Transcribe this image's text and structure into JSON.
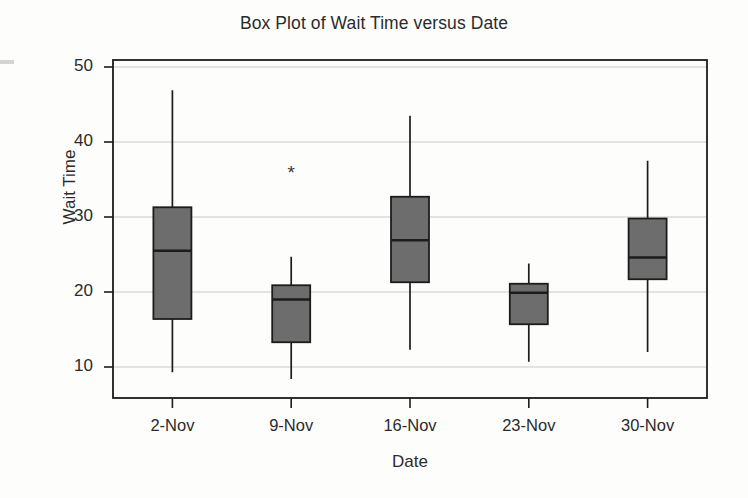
{
  "chart_data": {
    "type": "box",
    "title": "Box Plot of Wait Time versus Date",
    "xlabel": "Date",
    "ylabel": "Wait Time",
    "categories": [
      "2-Nov",
      "9-Nov",
      "16-Nov",
      "23-Nov",
      "30-Nov"
    ],
    "ytick_labels": [
      "10",
      "20",
      "30",
      "40",
      "50"
    ],
    "yticks": [
      10,
      20,
      30,
      40,
      50
    ],
    "ylim": [
      6,
      51
    ],
    "grid": "horizontal",
    "legend": "none",
    "box_fill_color": "#6d6d6d",
    "box_edge_color": "#1c1c1c",
    "whisker_color": "#1c1c1c",
    "gridline_color": "#c9c9c9",
    "axis_color": "#1c1c1c",
    "boxes": [
      {
        "category": "2-Nov",
        "whisker_low": 9.3,
        "q1": 16.4,
        "median": 25.5,
        "q3": 31.3,
        "whisker_high": 46.9,
        "outliers": []
      },
      {
        "category": "9-Nov",
        "whisker_low": 8.4,
        "q1": 13.3,
        "median": 19.0,
        "q3": 20.9,
        "whisker_high": 24.7,
        "outliers": [
          35.9
        ]
      },
      {
        "category": "16-Nov",
        "whisker_low": 12.3,
        "q1": 21.3,
        "median": 26.9,
        "q3": 32.7,
        "whisker_high": 43.5,
        "outliers": []
      },
      {
        "category": "23-Nov",
        "whisker_low": 10.7,
        "q1": 15.7,
        "median": 19.9,
        "q3": 21.1,
        "whisker_high": 23.8,
        "outliers": []
      },
      {
        "category": "30-Nov",
        "whisker_low": 12.0,
        "q1": 21.7,
        "median": 24.6,
        "q3": 29.8,
        "whisker_high": 37.5,
        "outliers": []
      }
    ]
  }
}
